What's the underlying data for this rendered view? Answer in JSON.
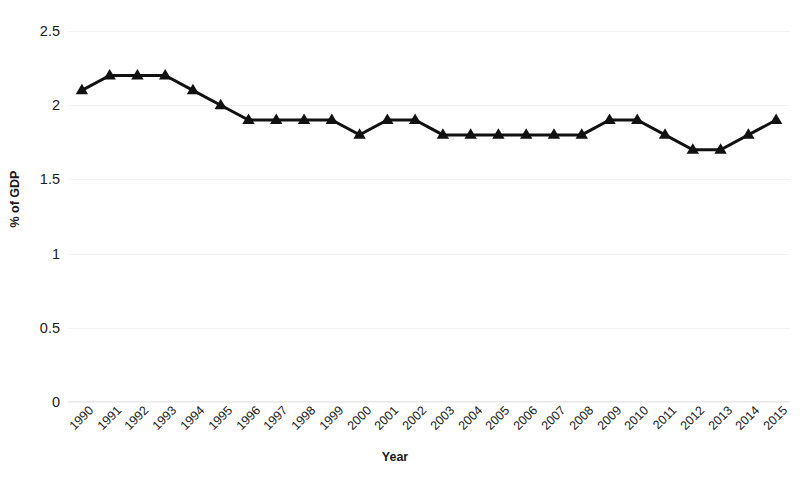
{
  "chart_data": {
    "type": "line",
    "title": "",
    "xlabel": "Year",
    "ylabel": "% of GDP",
    "categories": [
      "1990",
      "1991",
      "1992",
      "1993",
      "1994",
      "1995",
      "1996",
      "1997",
      "1998",
      "1999",
      "2000",
      "2001",
      "2002",
      "2003",
      "2004",
      "2005",
      "2006",
      "2007",
      "2008",
      "2009",
      "2010",
      "2011",
      "2012",
      "2013",
      "2014",
      "2015"
    ],
    "values": [
      2.1,
      2.2,
      2.2,
      2.2,
      2.1,
      2.0,
      1.9,
      1.9,
      1.9,
      1.9,
      1.8,
      1.9,
      1.9,
      1.8,
      1.8,
      1.8,
      1.8,
      1.8,
      1.8,
      1.9,
      1.9,
      1.8,
      1.7,
      1.7,
      1.8,
      1.9
    ],
    "ylim": [
      0,
      2.5
    ],
    "ytick_labels": [
      "2.5",
      "2",
      "1.5",
      "1",
      "0.5",
      "0"
    ],
    "ytick_values": [
      2.5,
      2,
      1.5,
      1,
      0.5,
      0
    ],
    "grid": true,
    "legend": "none",
    "series_color": "#111111",
    "marker": "triangle"
  },
  "axes": {
    "x_title": "Year",
    "y_title": "% of GDP"
  },
  "caption": {
    "text": ""
  }
}
